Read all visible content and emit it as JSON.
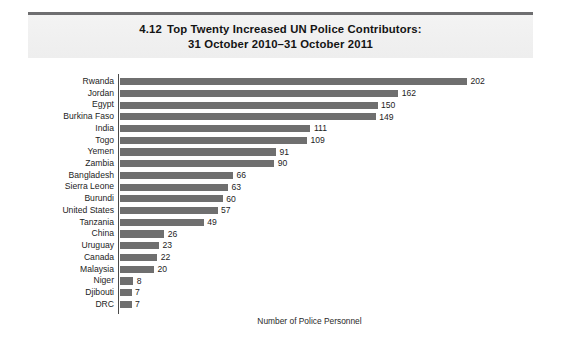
{
  "title": {
    "figure_number": "4.12",
    "line1": "Top Twenty Increased UN Police Contributors:",
    "line2": "31 October 2010–31 October 2011"
  },
  "chart_data": {
    "type": "bar",
    "orientation": "horizontal",
    "xlabel": "Number of Police Personnel",
    "ylabel": "",
    "xlim": [
      0,
      202
    ],
    "grid": false,
    "legend": false,
    "bar_color": "#6f6f6f",
    "categories": [
      "Rwanda",
      "Jordan",
      "Egypt",
      "Burkina Faso",
      "India",
      "Togo",
      "Yemen",
      "Zambia",
      "Bangladesh",
      "Sierra Leone",
      "Burundi",
      "United States",
      "Tanzania",
      "China",
      "Uruguay",
      "Canada",
      "Malaysia",
      "Niger",
      "Djibouti",
      "DRC"
    ],
    "values": [
      202,
      162,
      150,
      149,
      111,
      109,
      91,
      90,
      66,
      63,
      60,
      57,
      49,
      26,
      23,
      22,
      20,
      8,
      7,
      7
    ],
    "value_labels": [
      "202",
      "162",
      "150",
      "149",
      "111",
      "109",
      "91",
      "90",
      "66",
      "63",
      "60",
      "57",
      "49",
      "26",
      "23",
      "22",
      "20",
      "8",
      "7",
      "7"
    ]
  }
}
